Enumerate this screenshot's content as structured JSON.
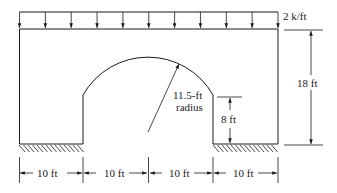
{
  "diagram": {
    "type": "structural-frame-with-circular-opening",
    "load": {
      "label": "2 k/ft",
      "arrow_count": 11,
      "type": "uniform-distributed"
    },
    "opening": {
      "radius_label": "11.5-ft",
      "radius_label_2": "radius"
    },
    "dimensions": {
      "height_total": "18 ft",
      "pier_height": "8 ft",
      "bottom": [
        "10 ft",
        "10 ft",
        "10 ft",
        "10 ft"
      ]
    },
    "supports": {
      "type": "fixed-hatched",
      "count": 2
    }
  }
}
